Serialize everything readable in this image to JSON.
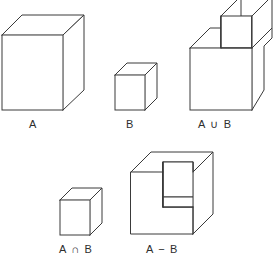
{
  "figure": {
    "background_color": "#ffffff",
    "line_color": "#3a3a3a",
    "face_color": "#ffffff",
    "text_color": "#2e2e2e",
    "width": 276,
    "height": 261
  },
  "shapes": [
    {
      "id": "cube-a",
      "label": "A",
      "description": "large cube representing set A",
      "label_x": 29,
      "label_y": 118
    },
    {
      "id": "cube-b",
      "label": "B",
      "description": "small cube representing set B",
      "label_x": 126,
      "label_y": 118
    },
    {
      "id": "union-ab",
      "label": "A ∪ B",
      "description": "union of A and B, a cube with a smaller cube protruding at the back top right",
      "label_x": 198,
      "label_y": 118
    },
    {
      "id": "intersection-ab",
      "label": "A ∩ B",
      "description": "intersection of A and B, a small cube",
      "label_x": 59,
      "label_y": 243
    },
    {
      "id": "difference-ab",
      "label": "A − B",
      "description": "difference A minus B, a cube with a rectangular notch removed from the top right front corner",
      "label_x": 146,
      "label_y": 243
    }
  ]
}
